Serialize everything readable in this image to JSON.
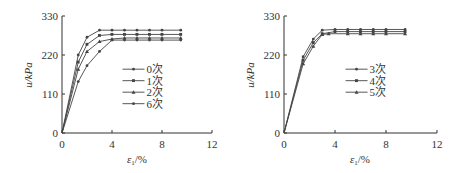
{
  "chart_data": [
    {
      "type": "line",
      "title": "",
      "xlabel": "ε₁/%",
      "ylabel": "u/kPa",
      "xlim": [
        0,
        12
      ],
      "ylim": [
        0,
        330
      ],
      "xticks": [
        0,
        4,
        8,
        12
      ],
      "yticks": [
        0,
        110,
        220,
        330
      ],
      "grid": false,
      "legend_position": "center-right",
      "series": [
        {
          "name": "0次",
          "x": [
            0,
            1.3,
            2,
            3,
            4,
            5,
            6,
            7,
            8,
            9.5
          ],
          "y": [
            0,
            220,
            270,
            290,
            290,
            290,
            290,
            290,
            290,
            290
          ]
        },
        {
          "name": "1次",
          "x": [
            0,
            1.3,
            2,
            3,
            4,
            5,
            6,
            7,
            8,
            9.5
          ],
          "y": [
            0,
            200,
            250,
            275,
            278,
            278,
            278,
            278,
            278,
            278
          ]
        },
        {
          "name": "2次",
          "x": [
            0,
            1.3,
            2,
            3,
            4,
            5,
            6,
            7,
            8,
            9.5
          ],
          "y": [
            0,
            180,
            230,
            258,
            265,
            268,
            268,
            268,
            268,
            268
          ]
        },
        {
          "name": "6次",
          "x": [
            0,
            1.3,
            2,
            3,
            4,
            5,
            6,
            7,
            8,
            9.5
          ],
          "y": [
            0,
            145,
            190,
            230,
            262,
            262,
            262,
            262,
            262,
            262
          ]
        }
      ]
    },
    {
      "type": "line",
      "title": "",
      "xlabel": "ε₁/%",
      "ylabel": "u/kPa",
      "xlim": [
        0,
        12
      ],
      "ylim": [
        0,
        330
      ],
      "xticks": [
        0,
        4,
        8,
        12
      ],
      "yticks": [
        0,
        110,
        220,
        330
      ],
      "grid": false,
      "legend_position": "center-right",
      "series": [
        {
          "name": "3次",
          "x": [
            0,
            1.5,
            2.3,
            3,
            4,
            5,
            6,
            7,
            8,
            9.5
          ],
          "y": [
            0,
            215,
            265,
            290,
            292,
            292,
            292,
            292,
            292,
            292
          ]
        },
        {
          "name": "4次",
          "x": [
            0,
            1.5,
            2.3,
            3,
            4,
            5,
            6,
            7,
            8,
            9.5
          ],
          "y": [
            0,
            205,
            255,
            280,
            286,
            286,
            286,
            286,
            286,
            286
          ]
        },
        {
          "name": "5次",
          "x": [
            0,
            1.5,
            2.3,
            3,
            3.5,
            5,
            6,
            7,
            8,
            9.5
          ],
          "y": [
            0,
            195,
            245,
            278,
            280,
            280,
            280,
            280,
            280,
            280
          ]
        }
      ]
    }
  ],
  "labels": {
    "left": {
      "ylabel": "u/kPa",
      "xlabel_main": "ε",
      "xlabel_sub": "1",
      "xlabel_unit": "/%",
      "yticks": [
        "330",
        "220",
        "110",
        "0"
      ],
      "xticks": [
        "0",
        "4",
        "8",
        "12"
      ]
    },
    "right": {
      "ylabel": "u/kPa",
      "xlabel_main": "ε",
      "xlabel_sub": "1",
      "xlabel_unit": "/%",
      "yticks": [
        "330",
        "220",
        "110",
        "0"
      ],
      "xticks": [
        "0",
        "4",
        "8",
        "12"
      ]
    }
  },
  "colors": {
    "axis": "#333333",
    "line": "#444444"
  }
}
